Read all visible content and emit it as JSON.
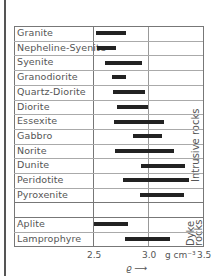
{
  "chart_data": {
    "type": "bar",
    "orientation": "horizontal-range",
    "title": "",
    "xlabel": "ρ",
    "xunit": "g cm⁻³",
    "xlim": [
      2.5,
      3.5
    ],
    "xticks": [
      "2.5",
      "3.0",
      "3.5"
    ],
    "grid": true,
    "groups": [
      {
        "name": "Intrusive rocks",
        "rows": [
          {
            "label": "Granite",
            "min": 2.53,
            "max": 2.8
          },
          {
            "label": "Nepheline-Syenite",
            "min": 2.54,
            "max": 2.71
          },
          {
            "label": "Syenite",
            "min": 2.61,
            "max": 2.95
          },
          {
            "label": "Granodiorite",
            "min": 2.67,
            "max": 2.8
          },
          {
            "label": "Quartz-Diorite",
            "min": 2.68,
            "max": 2.97
          },
          {
            "label": "Diorite",
            "min": 2.72,
            "max": 3.0
          },
          {
            "label": "Essexite",
            "min": 2.69,
            "max": 3.15
          },
          {
            "label": "Gabbro",
            "min": 2.86,
            "max": 3.13
          },
          {
            "label": "Norite",
            "min": 2.7,
            "max": 3.24
          },
          {
            "label": "Dunite",
            "min": 2.94,
            "max": 3.34
          },
          {
            "label": "Peridotite",
            "min": 2.77,
            "max": 3.37
          },
          {
            "label": "Pyroxenite",
            "min": 2.93,
            "max": 3.33
          }
        ]
      },
      {
        "name": "Dyke rocks",
        "rows": [
          {
            "label": "Aplite",
            "min": 2.51,
            "max": 2.82
          },
          {
            "label": "Lamprophyre",
            "min": 2.79,
            "max": 3.2
          }
        ]
      }
    ]
  },
  "labels": {
    "group_intrusive": "Intrusive rocks",
    "group_dyke_1": "Dyke",
    "group_dyke_2": "rocks",
    "tick_25": "2.5",
    "tick_30": "3.0",
    "tick_35": "3.5",
    "unit": "g cm⁻³",
    "axis_symbol": "ϱ ⟶"
  }
}
